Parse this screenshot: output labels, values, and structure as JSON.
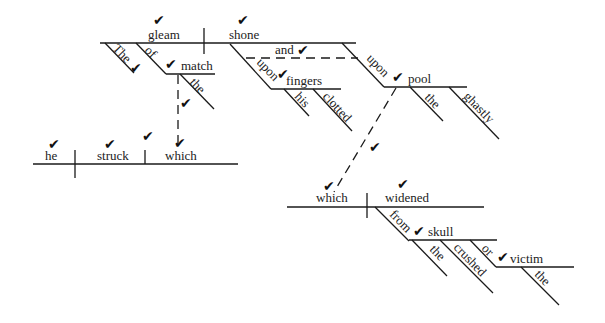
{
  "diagram": {
    "type": "sentence-diagram",
    "check_glyph": "✔",
    "words": {
      "gleam": "gleam",
      "the1": "The",
      "of1": "of",
      "match": "match",
      "the2": "the",
      "shone": "shone",
      "and": "and",
      "upon1": "upon",
      "fingers": "fingers",
      "his": "his",
      "clotted": "clotted",
      "upon2": "upon",
      "pool": "pool",
      "the3": "the",
      "ghastly": "ghastly",
      "he": "he",
      "struck": "struck",
      "which1": "which",
      "which2": "which",
      "widened": "widened",
      "from": "from",
      "skull": "skull",
      "the4": "the",
      "crushed": "crushed",
      "of2": "or",
      "victim": "victim",
      "the5": "the"
    }
  }
}
